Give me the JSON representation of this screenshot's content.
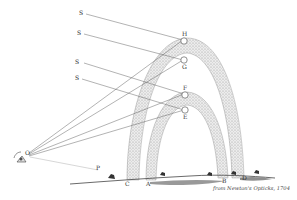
{
  "figure": {
    "caption": "from Newton's Opticks, 1704",
    "colors": {
      "ink": "#555555",
      "band": "#c9c9c9",
      "background": "#ffffff"
    },
    "labels": {
      "sun_rays": [
        "S",
        "S",
        "S",
        "S"
      ],
      "observer": "O",
      "horizon_point": "P",
      "outer_bow_top_points": [
        "H",
        "G"
      ],
      "inner_bow_top_points": [
        "F",
        "E"
      ],
      "inner_bow_feet": [
        "A",
        "B"
      ],
      "outer_bow_feet": [
        "C",
        "D"
      ]
    }
  }
}
